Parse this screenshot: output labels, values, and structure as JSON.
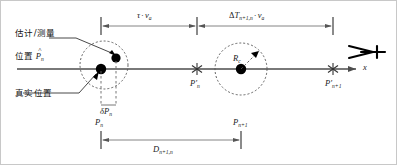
{
  "figure": {
    "axis_label": "x",
    "colors": {
      "line": "#4d4d4d",
      "marker": "#000000",
      "dashed": "#555555",
      "text": "#1a1a1a",
      "border": "#c8c8c8",
      "background": "#ffffff"
    }
  },
  "annotations": {
    "estimated_line1": "估计/测量",
    "estimated_line2_prefix": "位置",
    "estimated_symbol_base": "P",
    "estimated_symbol_hat": "^",
    "estimated_symbol_sub": "n",
    "true_position": "真实位置"
  },
  "dimensions": {
    "tau_v": {
      "tau": "τ",
      "dot": "·",
      "v": "v",
      "v_sub": "a"
    },
    "delta_T": {
      "delta": "Δ",
      "T": "T",
      "T_sub": "n+1,n",
      "dot": "·",
      "v": "v",
      "v_sub": "a"
    },
    "distance": {
      "D": "D",
      "D_sub": "n+1,n"
    }
  },
  "markers": {
    "delta_p": {
      "delta": "δ",
      "base": "P",
      "sub": "n"
    },
    "p_n": {
      "base": "P",
      "sub": "n"
    },
    "p_n_plus_1": {
      "base": "P",
      "sub": "n+1"
    },
    "p_prime_n": {
      "base": "P",
      "prime": "′",
      "sub": "n"
    },
    "p_prime_n_plus_1": {
      "base": "P",
      "prime": "′",
      "sub": "n+1"
    },
    "radius": {
      "base": "R",
      "sub": "c"
    }
  },
  "icons": {
    "aircraft": "aircraft-icon",
    "axis_arrow": "axis-arrow-icon",
    "star_marker": "star-marker-icon",
    "dot_marker": "dot-marker-icon"
  }
}
